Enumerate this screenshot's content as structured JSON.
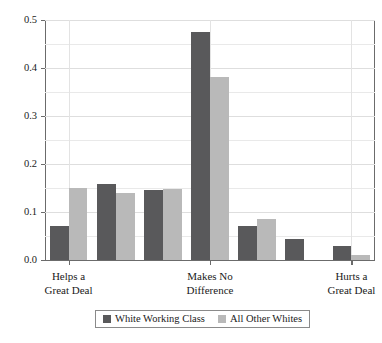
{
  "chart_data": {
    "type": "bar",
    "title": "",
    "subtitle": "",
    "xlabel": "",
    "ylabel": "",
    "ylim": [
      0.0,
      0.5
    ],
    "grid": true,
    "grid_interval": 0.05,
    "legend_position": "bottom-center",
    "orientation": "vertical",
    "grouped": true,
    "categories": [
      "1",
      "2",
      "3",
      "4",
      "5",
      "6",
      "7"
    ],
    "x_tick_labels": [
      "Helps a\nGreat Deal",
      "Makes No\nDifference",
      "Hurts a\nGreat Deal"
    ],
    "x_tick_positions": [
      1,
      4,
      7
    ],
    "y_tick_labels": [
      "0.0",
      "0.1",
      "0.2",
      "0.3",
      "0.4",
      "0.5"
    ],
    "y_tick_values": [
      0.0,
      0.1,
      0.2,
      0.3,
      0.4,
      0.5
    ],
    "series": [
      {
        "name": "White Working Class",
        "color": "#59595b",
        "values": [
          0.07,
          0.158,
          0.145,
          0.475,
          0.071,
          0.044,
          0.029
        ]
      },
      {
        "name": "All Other Whites",
        "color": "#b9b9b9",
        "values": [
          0.15,
          0.14,
          0.148,
          0.381,
          0.086,
          0.0,
          0.01
        ]
      }
    ]
  },
  "legend": {
    "entries": [
      {
        "label": "White Working Class",
        "swatch": "dark"
      },
      {
        "label": "All Other Whites",
        "swatch": "light"
      }
    ]
  }
}
